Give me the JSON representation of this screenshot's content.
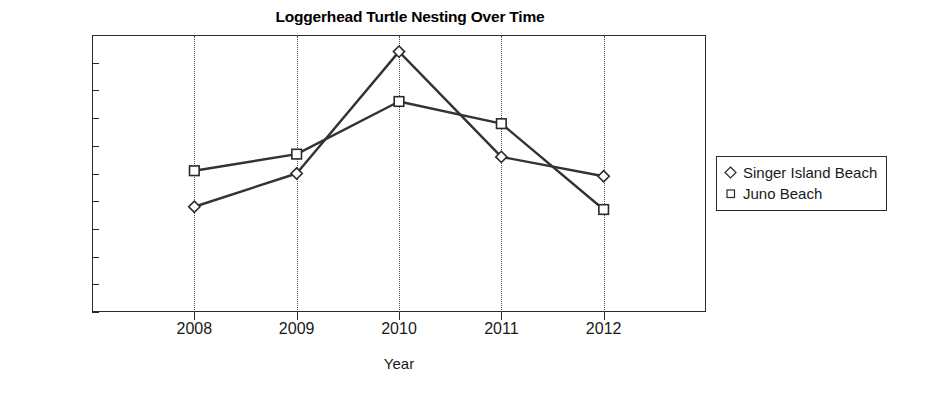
{
  "chart_data": {
    "type": "line",
    "title": "Loggerhead Turtle Nesting Over Time",
    "xlabel": "Year",
    "ylabel": "Number of Nests Sighted",
    "categories": [
      "2008",
      "2009",
      "2010",
      "2011",
      "2012"
    ],
    "x": [
      2008,
      2009,
      2010,
      2011,
      2012
    ],
    "xlim": [
      2007.5,
      2012.5
    ],
    "ylim": [
      0,
      50
    ],
    "yticks": [
      0,
      5,
      10,
      15,
      20,
      25,
      30,
      35,
      40,
      45,
      50
    ],
    "ytick_labels": [
      "0",
      "5",
      "10",
      "15",
      "20",
      "25",
      "30",
      "35",
      "40",
      "45",
      "50"
    ],
    "grid": "vertical dotted gridlines at each year",
    "legend_position": "right, outside plot",
    "series": [
      {
        "name": "Singer Island Beach",
        "marker": "open-diamond",
        "color": "#333333",
        "values": [
          19,
          25,
          47,
          28,
          24.5
        ]
      },
      {
        "name": "Juno Beach",
        "marker": "open-square",
        "color": "#333333",
        "values": [
          25.5,
          28.5,
          38,
          34,
          18.5
        ]
      }
    ]
  },
  "legend": {
    "items": [
      {
        "label": "Singer Island Beach",
        "marker": "diamond-marker-icon"
      },
      {
        "label": "Juno Beach",
        "marker": "square-marker-icon"
      }
    ]
  },
  "colors": {
    "axis": "#2a2a2a",
    "line": "#333333",
    "grid": "#4a4a4a",
    "text": "#1a1a1a",
    "background": "#ffffff"
  }
}
